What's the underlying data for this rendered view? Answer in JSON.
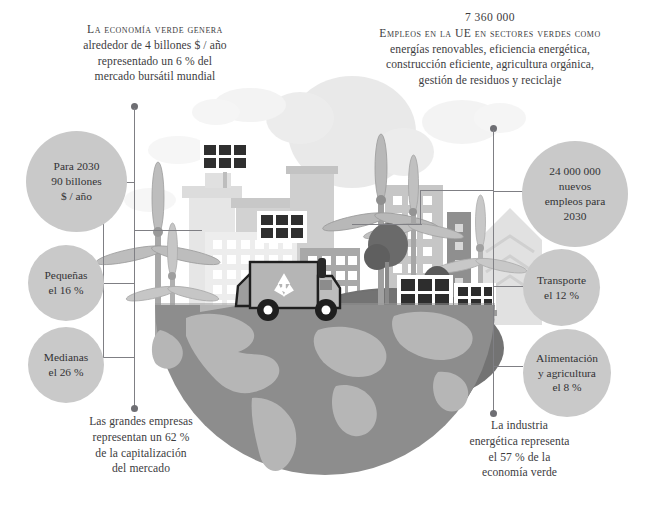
{
  "page": {
    "background": "#ffffff",
    "accent_gray": "#c9c9c9",
    "line_color": "#7f7f84",
    "text_color": "#3c3c3e"
  },
  "text_blocks": {
    "top_left": {
      "headline": "La economía verde genera",
      "lines": [
        "alrededor de 4 billones $ / año",
        "representado un 6 % del",
        "mercado bursátil mundial"
      ]
    },
    "top_right": {
      "number": "7 360 000",
      "headline": "Empleos en la UE en sectores verdes como",
      "lines": [
        "energías renovables, eficiencia energética,",
        "construcción eficiente, agricultura orgánica,",
        "gestión de residuos y reciclaje"
      ]
    },
    "bottom_left": {
      "lines": [
        "Las grandes empresas",
        "representan un 62 %",
        "de la capitalización",
        "del mercado"
      ]
    },
    "bottom_right": {
      "lines": [
        "La industria",
        "energética representa",
        "el 57 % de la",
        "economía verde"
      ]
    }
  },
  "callouts": {
    "left": [
      {
        "id": "para-2030",
        "lines": [
          "Para 2030",
          "90 billones",
          "$ / año"
        ]
      },
      {
        "id": "pequenas",
        "lines": [
          "Pequeñas",
          "el 16 %"
        ]
      },
      {
        "id": "medianas",
        "lines": [
          "Medianas",
          "el 26 %"
        ]
      }
    ],
    "right": [
      {
        "id": "nuevos-empleos",
        "lines": [
          "24 000 000",
          "nuevos",
          "empleos para",
          "2030"
        ]
      },
      {
        "id": "transporte",
        "lines": [
          "Transporte",
          "el 12 %"
        ]
      },
      {
        "id": "alimentacion",
        "lines": [
          "Alimentación",
          "y agricultura",
          "el 8 %"
        ]
      }
    ]
  },
  "illustration": {
    "name": "green-economy-scene",
    "elements": [
      "globe-hemisphere",
      "clouds",
      "city-buildings",
      "solar-panels",
      "wind-turbines",
      "trees",
      "recycling-truck",
      "green-hills"
    ],
    "colors": {
      "globe_ocean": "#8b8b8b",
      "globe_land": "#b9b9b9",
      "hill": "#6f6f6f",
      "cloud": "#e4e4e4",
      "building_light": "#dedede",
      "building_mid": "#c2c2c2",
      "building_dark": "#9a9a9a",
      "panel_dark": "#2e2e2e",
      "truck_body": "#a9a9a9"
    }
  }
}
